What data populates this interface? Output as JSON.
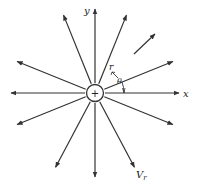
{
  "diagram": {
    "center_symbol": "+",
    "labels": {
      "x_axis": "x",
      "y_axis": "y",
      "radius": "r",
      "angle": "θ",
      "velocity": "V",
      "velocity_subscript": "r"
    },
    "ray_count": 12,
    "ray_angles_deg": [
      90,
      68,
      22,
      0,
      -22,
      -62,
      -90,
      -118,
      -158,
      180,
      158,
      112
    ],
    "colors": {
      "line": "#333333",
      "background": "#ffffff"
    }
  }
}
